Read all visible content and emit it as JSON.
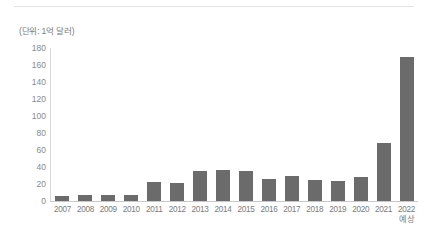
{
  "unit_note": "(단위: 1억 달러)",
  "chart_data": {
    "type": "bar",
    "title": "",
    "subtitle": "",
    "xlabel": "",
    "ylabel": "",
    "unit_note": "(단위: 1억 달러)",
    "ylim": [
      0,
      180
    ],
    "yticks": [
      0,
      20,
      40,
      60,
      80,
      100,
      120,
      140,
      160,
      180
    ],
    "ytick_labels": [
      "0",
      "20",
      "40",
      "60",
      "80",
      "100",
      "120",
      "140",
      "160",
      "180"
    ],
    "grid": false,
    "legend": null,
    "bar_color": "#6b6b6b",
    "categories": [
      "2007",
      "2008",
      "2009",
      "2010",
      "2011",
      "2012",
      "2013",
      "2014",
      "2015",
      "2016",
      "2017",
      "2018",
      "2019",
      "2020",
      "2021",
      "2022"
    ],
    "category_sublabels": [
      "",
      "",
      "",
      "",
      "",
      "",
      "",
      "",
      "",
      "",
      "",
      "",
      "",
      "",
      "",
      "예상"
    ],
    "values": [
      6,
      7,
      7,
      7,
      22,
      21,
      35,
      37,
      35,
      26,
      29,
      25,
      24,
      28,
      68,
      170
    ]
  }
}
